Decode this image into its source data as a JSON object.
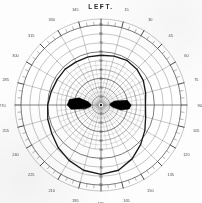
{
  "title": "LEFT.",
  "chart_data": {
    "type": "scatter",
    "chart_kind": "polar-visual-field-perimetry",
    "title": "LEFT.",
    "xlabel": "",
    "ylabel": "",
    "grid": true,
    "legend_position": "none",
    "angular_axis": {
      "label": "meridian (degrees)",
      "unit": "deg",
      "range": [
        0,
        360
      ],
      "tick_step": 15,
      "minor_tick_step": 5,
      "zero_at": "top",
      "direction": "clockwise",
      "tick_labels": [
        "0",
        "15",
        "30",
        "45",
        "60",
        "75",
        "90",
        "105",
        "120",
        "135",
        "150",
        "165",
        "180",
        "195",
        "210",
        "225",
        "240",
        "255",
        "270",
        "285",
        "300",
        "315",
        "330",
        "345"
      ]
    },
    "radial_axis": {
      "label": "eccentricity (degrees)",
      "unit": "deg",
      "range": [
        0,
        90
      ],
      "ring_step": 10,
      "ring_values": [
        10,
        20,
        30,
        40,
        50,
        60,
        70,
        80,
        90
      ],
      "meridian_tick_labels": [
        "10",
        "20",
        "30",
        "40",
        "50",
        "60",
        "70",
        "80",
        "90"
      ]
    },
    "center_marker": {
      "name": "fixation-point",
      "radius_deg": 0,
      "angle_deg": 0,
      "style": "filled-dot"
    },
    "series": [
      {
        "name": "isopter-boundary",
        "kind": "closed-polar-curve",
        "style": "solid-dark-line",
        "color": "#1a1a1a",
        "points_angle_deg": [
          0,
          15,
          30,
          45,
          60,
          75,
          90,
          105,
          120,
          135,
          150,
          165,
          180,
          195,
          210,
          225,
          240,
          255,
          270,
          285,
          300,
          315,
          330,
          345
        ],
        "points_radius_deg": [
          56,
          57,
          58,
          57,
          55,
          52,
          50,
          52,
          57,
          63,
          70,
          76,
          78,
          76,
          72,
          68,
          64,
          62,
          60,
          58,
          57,
          57,
          56,
          56
        ]
      },
      {
        "name": "scotoma-nasal",
        "kind": "filled-region",
        "color": "#000000",
        "centroid_angle_deg": 270,
        "centroid_radius_deg": 26,
        "vertices_angle_deg": [
          256,
          262,
          270,
          280,
          288,
          284,
          272,
          262
        ],
        "vertices_radius_deg": [
          18,
          34,
          38,
          36,
          26,
          15,
          11,
          12
        ]
      },
      {
        "name": "scotoma-temporal",
        "kind": "filled-region",
        "color": "#000000",
        "centroid_angle_deg": 90,
        "centroid_radius_deg": 24,
        "vertices_angle_deg": [
          74,
          80,
          90,
          98,
          104,
          100,
          90,
          80
        ],
        "vertices_radius_deg": [
          16,
          30,
          34,
          32,
          23,
          13,
          10,
          11
        ]
      }
    ],
    "annotations": [
      {
        "text": "LEFT.",
        "position": "top-center"
      }
    ]
  },
  "colors": {
    "paper": "#fdfdfd",
    "grid": "#5a5a5a",
    "grid_light": "#8d8d8d",
    "ink": "#1a1a1a",
    "scotoma": "#000000",
    "label": "#3a3a3a"
  }
}
